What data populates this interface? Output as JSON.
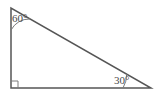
{
  "figure": {
    "type": "right-triangle-with-angle-labels",
    "background_color": "#ffffff",
    "stroke_color": "#555555",
    "text_color": "#4a4a4a",
    "stroke_width": 1.5,
    "vertices": {
      "top_left": {
        "x": 11,
        "y": 8
      },
      "bottom_left": {
        "x": 11,
        "y": 88
      },
      "bottom_right": {
        "x": 151,
        "y": 88
      }
    },
    "angles": {
      "top_left": {
        "label": "60°",
        "value": 60,
        "arc_radius": 22
      },
      "bottom_left": {
        "label": "",
        "value": 90,
        "marker": "right-angle-square",
        "marker_size": 7
      },
      "bottom_right": {
        "label": "30°",
        "value": 30,
        "arc_radius": 28
      }
    },
    "sides": {
      "vertical_leg": "left",
      "horizontal_leg": "bottom",
      "hypotenuse": "top-left-to-bottom-right"
    }
  }
}
